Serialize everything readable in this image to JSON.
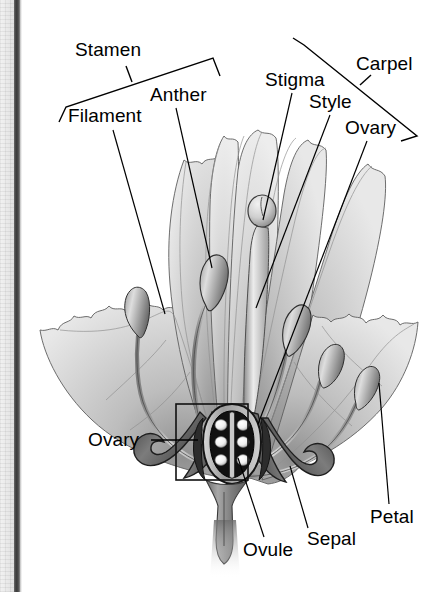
{
  "figure": {
    "style": "grayscale pencil/airbrush botanical illustration on white page",
    "page_edge": {
      "gutter_texture_color": "#eaeaea",
      "gutter_rule_color": "#3c3c3c"
    },
    "palette": {
      "ink": "#000000",
      "page": "#ffffff",
      "petal_light": "#e3e3e3",
      "petal_mid": "#c4c4c4",
      "petal_shadow": "#8f8f8f",
      "sepal_dark": "#5a5a5a",
      "ovary_wall": "#2a2a2a",
      "ovule_white": "#ffffff"
    }
  },
  "labels": [
    {
      "id": "stamen",
      "text": "Stamen",
      "kind": "bracket-group"
    },
    {
      "id": "filament",
      "text": "Filament",
      "kind": "leader-line"
    },
    {
      "id": "anther",
      "text": "Anther",
      "kind": "leader-line"
    },
    {
      "id": "stigma",
      "text": "Stigma",
      "kind": "leader-line"
    },
    {
      "id": "style",
      "text": "Style",
      "kind": "leader-line"
    },
    {
      "id": "carpel",
      "text": "Carpel",
      "kind": "bracket-group"
    },
    {
      "id": "ovary_top",
      "text": "Ovary",
      "kind": "leader-line"
    },
    {
      "id": "ovary_box",
      "text": "Ovary",
      "kind": "leader-line-to-box"
    },
    {
      "id": "ovule",
      "text": "Ovule",
      "kind": "leader-line"
    },
    {
      "id": "sepal",
      "text": "Sepal",
      "kind": "leader-line"
    },
    {
      "id": "petal",
      "text": "Petal",
      "kind": "leader-line"
    }
  ],
  "groups": {
    "stamen_bracket_members": [
      "Filament",
      "Anther"
    ],
    "carpel_bracket_members": [
      "Stigma",
      "Style",
      "Ovary"
    ]
  },
  "parts": {
    "stamen_count": 5,
    "carpel_count": 1,
    "ovary_chambers": 2,
    "ovules_per_chamber": 3,
    "ovule_total": 6,
    "detail_box": "rectangular callout around ovary cross-section"
  }
}
